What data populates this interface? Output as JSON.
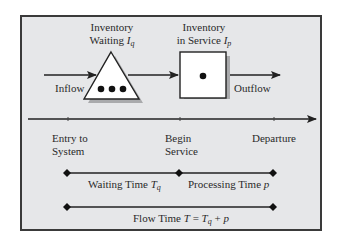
{
  "diagram": {
    "type": "process-flow",
    "nodes": {
      "queue": {
        "shape": "triangle",
        "label_line1": "Inventory",
        "label_line2": "Waiting",
        "symbol": "I",
        "symbol_sub": "q",
        "dots": 3
      },
      "server": {
        "shape": "square",
        "label_line1": "Inventory",
        "label_line2": "in Service",
        "symbol": "I",
        "symbol_sub": "p",
        "dots": 1
      }
    },
    "flows": {
      "inflow": "Inflow",
      "outflow": "Outflow"
    },
    "timeline": {
      "events": [
        {
          "line1": "Entry to",
          "line2": "System"
        },
        {
          "line1": "Begin",
          "line2": "Service"
        },
        {
          "line1": "Departure",
          "line2": ""
        }
      ]
    },
    "intervals": {
      "waiting": {
        "text": "Waiting Time ",
        "symbol": "T",
        "sub": "q"
      },
      "processing": {
        "text": "Processing Time ",
        "symbol": "p"
      },
      "flow": {
        "text": "Flow Time ",
        "symbol": "T",
        "eq": " = ",
        "symbol2": "T",
        "sub2": "q",
        "plus": " + ",
        "symbol3": "p"
      }
    },
    "colors": {
      "frame_bg": "#e6e7e9",
      "frame_border": "#3a3a3a",
      "line": "#222222",
      "shape_fill": "#ffffff",
      "shadow": "#a9aaac"
    }
  }
}
